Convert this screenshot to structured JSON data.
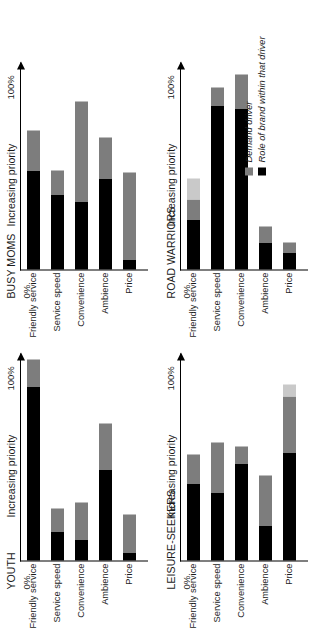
{
  "figure": {
    "axis_label": "Increasing priority",
    "tick_min": "0%",
    "tick_max": "100%"
  },
  "legend": {
    "items": [
      {
        "label": "Demand driver",
        "color": "#7d7d7d",
        "swatch": "driver-swatch"
      },
      {
        "label": "Role of brand within that driver",
        "color": "#000000",
        "swatch": "role-swatch"
      }
    ]
  },
  "chart_data": {
    "type": "bar",
    "orientation": "horizontal-stacked",
    "title": "",
    "xlabel": "Increasing priority",
    "ylabel": "",
    "xlim": [
      0,
      100
    ],
    "grid": false,
    "legend_position": "bottom-right",
    "categories": [
      "Friendly service",
      "Service speed",
      "Convenience",
      "Ambience",
      "Price"
    ],
    "series": [
      {
        "name": "Role of brand within that driver",
        "color": "#000000"
      },
      {
        "name": "Demand driver",
        "color": "#7d7d7d"
      }
    ],
    "panels": [
      {
        "name": "YOUTH",
        "bars": [
          {
            "category": "Friendly service",
            "role": 84,
            "driver": 13,
            "extra": 0,
            "total": 97
          },
          {
            "category": "Service speed",
            "role": 14,
            "driver": 11,
            "extra": 0,
            "total": 25
          },
          {
            "category": "Convenience",
            "role": 10,
            "driver": 18,
            "extra": 0,
            "total": 28
          },
          {
            "category": "Ambience",
            "role": 44,
            "driver": 22,
            "extra": 0,
            "total": 66
          },
          {
            "category": "Price",
            "role": 4,
            "driver": 18,
            "extra": 0,
            "total": 22
          }
        ]
      },
      {
        "name": "BUSY MOMS",
        "bars": [
          {
            "category": "Friendly service",
            "role": 48,
            "driver": 19,
            "extra": 0,
            "total": 67
          },
          {
            "category": "Service speed",
            "role": 36,
            "driver": 12,
            "extra": 0,
            "total": 48
          },
          {
            "category": "Convenience",
            "role": 33,
            "driver": 48,
            "extra": 0,
            "total": 81
          },
          {
            "category": "Ambience",
            "role": 44,
            "driver": 20,
            "extra": 0,
            "total": 64
          },
          {
            "category": "Price",
            "role": 5,
            "driver": 42,
            "extra": 0,
            "total": 47
          }
        ]
      },
      {
        "name": "LEISURE-SEEKERS",
        "bars": [
          {
            "category": "Friendly service",
            "role": 37,
            "driver": 14,
            "extra": 0,
            "total": 51
          },
          {
            "category": "Service speed",
            "role": 33,
            "driver": 24,
            "extra": 0,
            "total": 57
          },
          {
            "category": "Convenience",
            "role": 47,
            "driver": 8,
            "extra": 0,
            "total": 55
          },
          {
            "category": "Ambience",
            "role": 17,
            "driver": 24,
            "extra": 0,
            "total": 41
          },
          {
            "category": "Price",
            "role": 52,
            "driver": 27,
            "extra": 6,
            "total": 85
          }
        ]
      },
      {
        "name": "ROAD WARRIORS",
        "bars": [
          {
            "category": "Friendly service",
            "role": 24,
            "driver": 10,
            "extra": 10,
            "total": 44
          },
          {
            "category": "Service speed",
            "role": 79,
            "driver": 9,
            "extra": 0,
            "total": 88
          },
          {
            "category": "Convenience",
            "role": 78,
            "driver": 16,
            "extra": 0,
            "total": 94
          },
          {
            "category": "Ambience",
            "role": 13,
            "driver": 8,
            "extra": 0,
            "total": 21
          },
          {
            "category": "Price",
            "role": 8,
            "driver": 5,
            "extra": 0,
            "total": 13
          }
        ]
      }
    ]
  }
}
